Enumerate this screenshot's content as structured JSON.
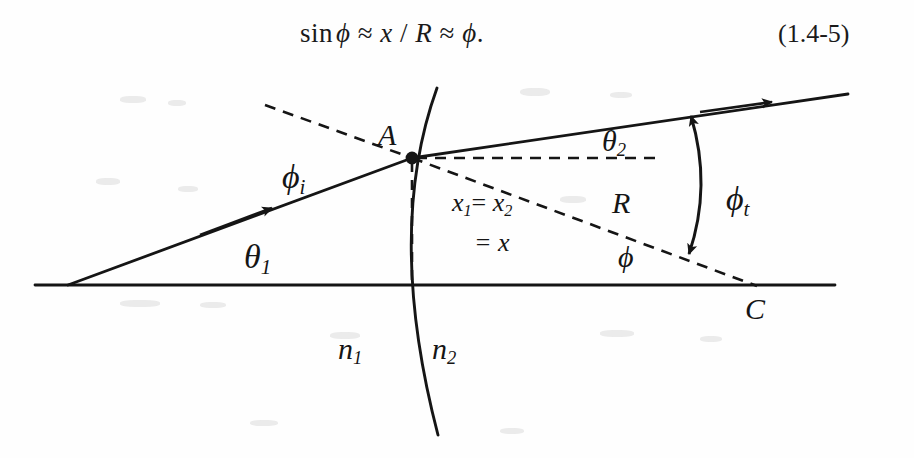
{
  "equation": {
    "text": "sin ϕ ≈ x / R ≈ ϕ .",
    "parts": {
      "sin": "sin",
      "phi1": "ϕ",
      "approx1": "≈",
      "x": "x",
      "slash": "/",
      "R": "R",
      "approx2": "≈",
      "phi2": "ϕ",
      "period": "."
    },
    "number": "(1.4-5)"
  },
  "figure": {
    "labels": {
      "vertex_A": "A",
      "center_C": "C",
      "phi_i": "ϕ",
      "phi_i_sub": "i",
      "phi_t": "ϕ",
      "phi_t_sub": "t",
      "theta_1": "θ",
      "theta_1_sub": "1",
      "theta_2": "θ",
      "theta_2_sub": "2",
      "radius_R": "R",
      "angle_phi": "ϕ",
      "index_n1": "n",
      "index_n1_sub": "1",
      "index_n2": "n",
      "index_n2_sub": "2",
      "height_line1_a": "x",
      "height_line1_a_sub": "1",
      "height_line1_eq": "=",
      "height_line1_b": "x",
      "height_line1_b_sub": "2",
      "height_line2": "= x"
    },
    "colors": {
      "ink": "#151515",
      "background": "#fefefe"
    },
    "geometry": {
      "optical_axis": {
        "x1": 35,
        "y1": 223,
        "x2": 835,
        "y2": 223
      },
      "vertex_A": {
        "x": 412,
        "y": 96
      },
      "center_C": {
        "x": 755,
        "y": 223
      },
      "incident_ray": {
        "x1": 68,
        "y1": 223,
        "x2": 412,
        "y2": 96
      },
      "refracted_ray": {
        "x1": 412,
        "y1": 96,
        "x2": 848,
        "y2": 32
      },
      "normal_dashed": {
        "x1": 265,
        "y1": 43,
        "x2": 412,
        "y2": 96
      },
      "horizontal_dashed": {
        "x1": 412,
        "y1": 96,
        "x2": 660,
        "y2": 96
      },
      "radius_dashed": {
        "x1": 412,
        "y1": 96,
        "x2": 755,
        "y2": 223
      },
      "height_dashed": {
        "x1": 412,
        "y1": 96,
        "x2": 412,
        "y2": 223
      },
      "surface_arc": {
        "top_x": 437,
        "top_y": 26,
        "bottom_x": 438,
        "bottom_y": 373
      },
      "phi_t_arc": {
        "x1": 690,
        "y1": 53,
        "x2": 688,
        "y2": 193
      }
    }
  }
}
